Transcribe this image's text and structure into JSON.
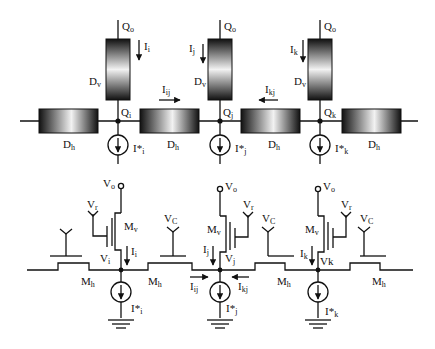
{
  "diagram": {
    "type": "circuit-schematic",
    "top_section": {
      "description": "Diffusion network model",
      "nodes": [
        {
          "id": "i",
          "node_label": "Q",
          "node_sub": "i",
          "output_label": "Q",
          "output_sub": "o",
          "vertical_current": "I",
          "vertical_current_sub": "i",
          "source_label": "I*",
          "source_sub": "i"
        },
        {
          "id": "j",
          "node_label": "Q",
          "node_sub": "j",
          "output_label": "Q",
          "output_sub": "o",
          "vertical_current": "I",
          "vertical_current_sub": "j",
          "source_label": "I*",
          "source_sub": "j"
        },
        {
          "id": "k",
          "node_label": "Q",
          "node_sub": "k",
          "output_label": "Q",
          "output_sub": "o",
          "vertical_current": "I",
          "vertical_current_sub": "k",
          "source_label": "I*",
          "source_sub": "k"
        }
      ],
      "vertical_element": {
        "label": "D",
        "sub": "v"
      },
      "horizontal_element": {
        "label": "D",
        "sub": "h"
      },
      "lateral_currents": [
        {
          "label": "I",
          "sub": "ij",
          "direction": "right"
        },
        {
          "label": "I",
          "sub": "kj",
          "direction": "left"
        }
      ]
    },
    "bottom_section": {
      "description": "Transistor implementation",
      "nodes": [
        {
          "id": "i",
          "supply": "V",
          "supply_sub": "o",
          "ref": "V",
          "ref_sub": "r",
          "transistor": "M",
          "transistor_sub": "v",
          "node_voltage": "V",
          "node_voltage_sub": "i",
          "current": "I",
          "current_sub": "i",
          "source": "I*",
          "source_sub": "i"
        },
        {
          "id": "j",
          "supply": "V",
          "supply_sub": "o",
          "ref": "V",
          "ref_sub": "r",
          "transistor": "M",
          "transistor_sub": "v",
          "node_voltage": "V",
          "node_voltage_sub": "j",
          "current": "I",
          "current_sub": "j",
          "source": "I*",
          "source_sub": "j"
        },
        {
          "id": "k",
          "supply": "V",
          "supply_sub": "o",
          "ref": "V",
          "ref_sub": "r",
          "transistor": "M",
          "transistor_sub": "v",
          "node_voltage": "Vk",
          "node_voltage_sub": "",
          "current": "I",
          "current_sub": "k",
          "source": "I*",
          "source_sub": "k"
        }
      ],
      "horizontal_transistor": {
        "label": "M",
        "sub": "h"
      },
      "gate_voltage": {
        "label": "V",
        "sub": "C"
      },
      "lateral_currents": [
        {
          "label": "I",
          "sub": "ij",
          "direction": "right"
        },
        {
          "label": "I",
          "sub": "kj",
          "direction": "left"
        }
      ]
    }
  }
}
